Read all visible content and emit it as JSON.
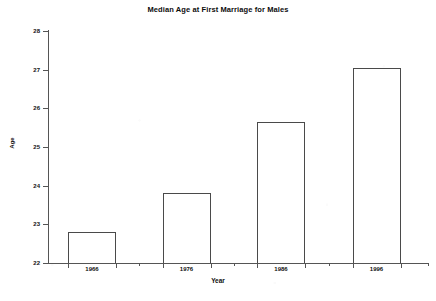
{
  "chart_data": {
    "type": "bar",
    "title": "Median Age at First Marriage for Males",
    "xlabel": "Year",
    "ylabel": "Age",
    "categories": [
      "1966",
      "1976",
      "1986",
      "1996"
    ],
    "values": [
      22.8,
      23.8,
      25.65,
      27.05
    ],
    "ylim": [
      22,
      28
    ],
    "yticks": [
      "22",
      "23",
      "24",
      "25",
      "26",
      "27",
      "28"
    ],
    "grid": false,
    "legend": false,
    "bar_fill": "#ffffff",
    "bar_edge": "#4a4a4a",
    "axis_color": "#555555",
    "text_color": "#101010"
  }
}
